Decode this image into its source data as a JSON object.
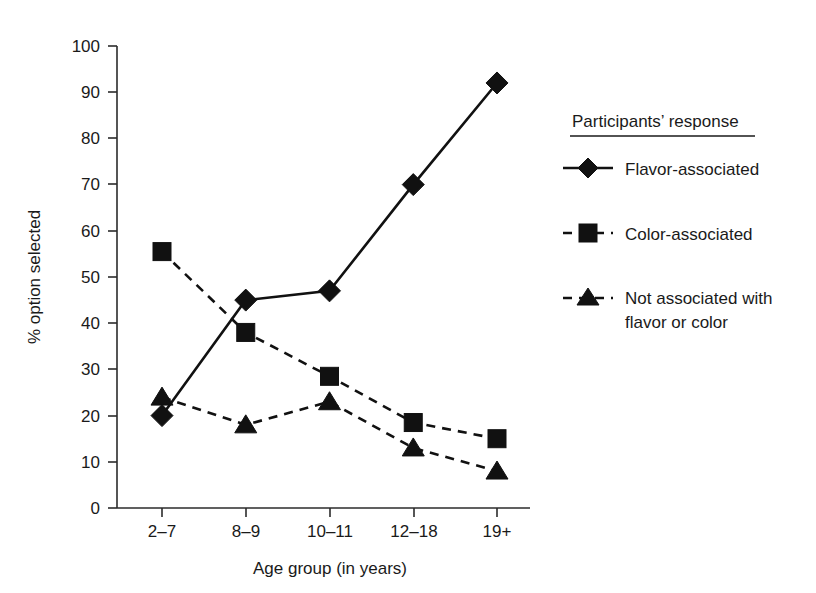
{
  "chart_data": {
    "type": "line",
    "title": "",
    "xlabel": "Age group (in years)",
    "ylabel": "% option selected",
    "categories": [
      "2–7",
      "8–9",
      "10–11",
      "12–18",
      "19+"
    ],
    "ylim": [
      0,
      100
    ],
    "ytick_labels": [
      "0",
      "10",
      "20",
      "30",
      "40",
      "50",
      "60",
      "70",
      "80",
      "90",
      "100"
    ],
    "ytick_values": [
      0,
      10,
      20,
      30,
      40,
      50,
      60,
      70,
      80,
      90,
      100
    ],
    "grid": false,
    "legend_position": "right",
    "legend_title": "Participants’ response",
    "series": [
      {
        "name": "Flavor-associated",
        "values": [
          20,
          45,
          47,
          70,
          92
        ],
        "marker": "diamond",
        "line_style": "solid",
        "color": "#111111"
      },
      {
        "name": "Color-associated",
        "values": [
          55.5,
          38,
          28.5,
          18.5,
          15
        ],
        "marker": "square",
        "line_style": "dashed",
        "color": "#111111"
      },
      {
        "name": "Not associated with flavor or color",
        "values": [
          24,
          18,
          23,
          13,
          8
        ],
        "marker": "triangle",
        "line_style": "dashed",
        "color": "#111111"
      }
    ]
  },
  "legend": {
    "title": "Participants’ response",
    "entries": [
      {
        "label": "Flavor-associated",
        "marker": "diamond",
        "line_style": "solid"
      },
      {
        "label": "Color-associated",
        "marker": "square",
        "line_style": "dashed"
      },
      {
        "label_line1": "Not associated with",
        "label_line2": "flavor or color",
        "marker": "triangle",
        "line_style": "dashed"
      }
    ]
  },
  "axes": {
    "x_title": "Age group (in years)",
    "y_title": "% option selected",
    "x_categories": [
      "2–7",
      "8–9",
      "10–11",
      "12–18",
      "19+"
    ],
    "y_ticks": [
      "0",
      "10",
      "20",
      "30",
      "40",
      "50",
      "60",
      "70",
      "80",
      "90",
      "100"
    ]
  },
  "colors": {
    "ink": "#111111",
    "axis": "#2b2b2b",
    "background": "#ffffff"
  }
}
